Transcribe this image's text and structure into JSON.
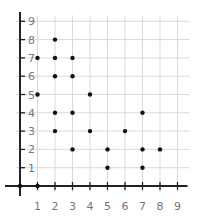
{
  "chart_data": {
    "type": "scatter",
    "title": "",
    "xlabel": "",
    "ylabel": "",
    "xlim": [
      0,
      9
    ],
    "ylim": [
      0,
      9
    ],
    "grid": true,
    "legend": null,
    "x_ticks": [
      "1",
      "2",
      "3",
      "4",
      "5",
      "6",
      "7",
      "8",
      "9"
    ],
    "y_ticks": [
      "1",
      "2",
      "3",
      "4",
      "5",
      "6",
      "7",
      "8",
      "9"
    ],
    "points": [
      {
        "x": 0,
        "y": 0
      },
      {
        "x": 1,
        "y": 0
      },
      {
        "x": 1,
        "y": 5
      },
      {
        "x": 1,
        "y": 7
      },
      {
        "x": 2,
        "y": 3
      },
      {
        "x": 2,
        "y": 4
      },
      {
        "x": 2,
        "y": 6
      },
      {
        "x": 2,
        "y": 7
      },
      {
        "x": 2,
        "y": 8
      },
      {
        "x": 3,
        "y": 2
      },
      {
        "x": 3,
        "y": 4
      },
      {
        "x": 3,
        "y": 6
      },
      {
        "x": 3,
        "y": 7
      },
      {
        "x": 4,
        "y": 3
      },
      {
        "x": 4,
        "y": 5
      },
      {
        "x": 5,
        "y": 1
      },
      {
        "x": 5,
        "y": 2
      },
      {
        "x": 6,
        "y": 3
      },
      {
        "x": 7,
        "y": 1
      },
      {
        "x": 7,
        "y": 2
      },
      {
        "x": 7,
        "y": 4
      },
      {
        "x": 8,
        "y": 2
      }
    ],
    "colors": {
      "point": "#111111",
      "axis": "#222222",
      "grid": "#d9d9d9",
      "label": "#777777"
    }
  }
}
